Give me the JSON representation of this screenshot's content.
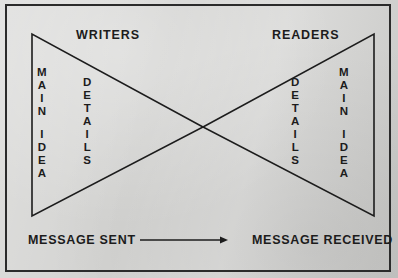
{
  "figure": {
    "type": "bowtie-hourglass-diagram",
    "background_color": "#d2d2d0",
    "ink_color": "#1c1c1c",
    "frame": {
      "stroke": "#2b2b2b",
      "stroke_width": 2
    }
  },
  "headings": {
    "left": "WRITERS",
    "right": "READERS"
  },
  "left_triangle": {
    "role": "writers",
    "orientation": "apex-right",
    "vertices": [
      [
        32,
        34
      ],
      [
        32,
        216
      ],
      [
        203,
        127
      ]
    ],
    "columns": [
      {
        "name": "main-idea",
        "text": "MAIN IDEA",
        "lines": [
          "MAIN",
          "IDEA"
        ]
      },
      {
        "name": "details",
        "text": "DETAILS",
        "lines": [
          "DETAILS"
        ]
      }
    ]
  },
  "right_triangle": {
    "role": "readers",
    "orientation": "apex-left",
    "vertices": [
      [
        374,
        34
      ],
      [
        374,
        216
      ],
      [
        203,
        127
      ]
    ],
    "columns": [
      {
        "name": "details",
        "text": "DETAILS",
        "lines": [
          "DETAILS"
        ]
      },
      {
        "name": "main-idea",
        "text": "MAIN IDEA",
        "lines": [
          "MAIN",
          "IDEA"
        ]
      }
    ]
  },
  "flow": {
    "from_label": "MESSAGE SENT",
    "to_label": "MESSAGE RECEIVED",
    "arrow": {
      "direction": "right",
      "x_start": 140,
      "x_end": 228,
      "y": 240
    }
  },
  "vertical_text": {
    "writers_main_idea": [
      "M",
      "A",
      "I",
      "N",
      "",
      "I",
      "D",
      "E",
      "A"
    ],
    "writers_details": [
      "D",
      "E",
      "T",
      "A",
      "I",
      "L",
      "S"
    ],
    "readers_details": [
      "D",
      "E",
      "T",
      "A",
      "I",
      "L",
      "S"
    ],
    "readers_main_idea": [
      "M",
      "A",
      "I",
      "N",
      "",
      "I",
      "D",
      "E",
      "A"
    ]
  }
}
